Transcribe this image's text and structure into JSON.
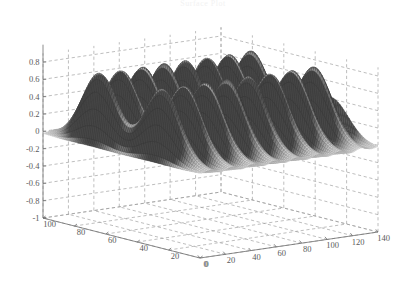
{
  "figure": {
    "title": "Surface Plot",
    "background_color": "#ffffff",
    "axis_color": "#6f6f6f",
    "grid_color": "#9a9a9a",
    "mesh_color": "#555555"
  },
  "chart_data": {
    "type": "line",
    "render_style": "3d-mesh-surface",
    "title": "Surface Plot",
    "xlabel": "",
    "ylabel": "",
    "zlabel": "",
    "grid": true,
    "legend": null,
    "x": {
      "ticks": [
        0,
        20,
        40,
        60,
        80,
        100,
        120,
        140
      ],
      "tick_labels": [
        "0",
        "20",
        "40",
        "60",
        "80",
        "100",
        "120",
        "140"
      ],
      "range": [
        0,
        140
      ]
    },
    "y": {
      "ticks": [
        0,
        20,
        40,
        60,
        80,
        100
      ],
      "tick_labels": [
        "0",
        "20",
        "40",
        "60",
        "80",
        "100"
      ],
      "range": [
        0,
        100
      ]
    },
    "z": {
      "ticks": [
        -1,
        -0.8,
        -0.6,
        -0.4,
        -0.2,
        0,
        0.2,
        0.4,
        0.6,
        0.8
      ],
      "tick_labels": [
        "-1",
        "-0.8",
        "-0.6",
        "-0.4",
        "-0.2",
        "0",
        "0.2",
        "0.4",
        "0.6",
        "0.8"
      ],
      "range": [
        -1,
        0.9
      ]
    },
    "surface": {
      "description": "Two parallel ridges of periodic sinusoidal bumps rising from a flat mid-level plane",
      "amplitude": 0.85,
      "ridge_centers_y": [
        30,
        70
      ],
      "ridge_sigma": 11,
      "bump_period_x": 17,
      "baseline_z": -0.02,
      "nx": 110,
      "ny": 88
    }
  },
  "axes": {
    "z_tick_values": [
      "0.8",
      "0.6",
      "0.4",
      "0.2",
      "0",
      "-0.2",
      "-0.4",
      "-0.6",
      "-0.8",
      "-1"
    ],
    "y_tick_values": [
      "100",
      "80",
      "60",
      "40",
      "20",
      "0"
    ],
    "x_tick_values": [
      "0",
      "20",
      "40",
      "60",
      "80",
      "100",
      "120",
      "140"
    ]
  }
}
